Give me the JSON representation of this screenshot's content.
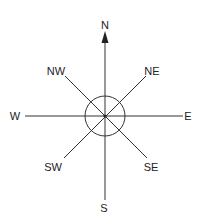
{
  "diagram": {
    "type": "compass-rose",
    "center": {
      "x": 105,
      "y": 116
    },
    "circle_radius": 20,
    "line_color": "#333333",
    "text_color": "#222222",
    "directions": {
      "n": "N",
      "ne": "NE",
      "e": "E",
      "se": "SE",
      "s": "S",
      "sw": "SW",
      "w": "W",
      "nw": "NW"
    }
  }
}
